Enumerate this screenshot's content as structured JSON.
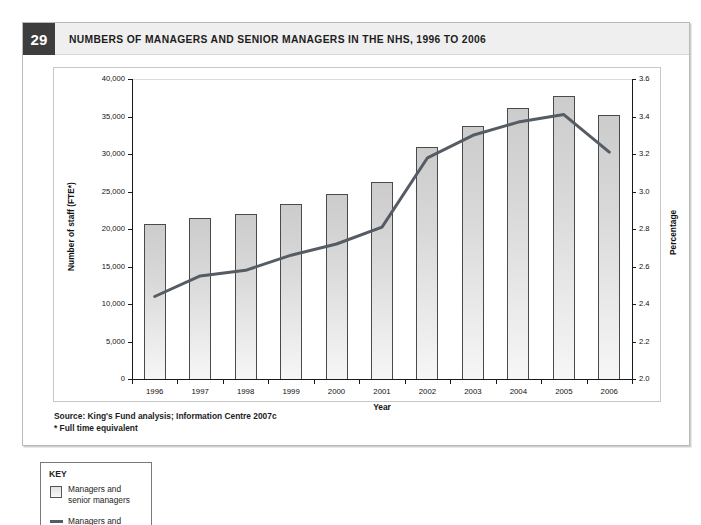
{
  "figure": {
    "number": "29",
    "title": "NUMBERS OF MANAGERS AND SENIOR MANAGERS IN THE NHS, 1996 TO 2006"
  },
  "notes": {
    "source": "Source: King's Fund analysis; Information Centre 2007c",
    "footnote": "* Full time equivalent"
  },
  "key": {
    "heading": "KEY",
    "bar_label_line1": "Managers and",
    "bar_label_line2": "senior managers",
    "line_label_line1": "Managers and"
  },
  "colors": {
    "badge_bg": "#3d3d3d",
    "header_bg": "#efefef",
    "bar_fill_top": "#cccccc",
    "bar_fill_bottom": "#f6f6f6",
    "bar_stroke": "#4a4a4a",
    "line_color": "#555c63",
    "axis_color": "#1a1a1a"
  },
  "chart_data": {
    "type": "bar",
    "title": "NUMBERS OF MANAGERS AND SENIOR MANAGERS IN THE NHS, 1996 TO 2006",
    "xlabel": "Year",
    "ylabel": "Number of staff (FTE*)",
    "y2label": "Percentage",
    "grid": false,
    "legend_position": "below-left",
    "categories": [
      "1996",
      "1997",
      "1998",
      "1999",
      "2000",
      "2001",
      "2002",
      "2003",
      "2004",
      "2005",
      "2006"
    ],
    "ylim": [
      0,
      40000
    ],
    "yticks": [
      "0",
      "5,000",
      "10,000",
      "15,000",
      "20,000",
      "25,000",
      "30,000",
      "35,000",
      "40,000"
    ],
    "ytick_values": [
      0,
      5000,
      10000,
      15000,
      20000,
      25000,
      30000,
      35000,
      40000
    ],
    "y2lim": [
      2.0,
      3.6
    ],
    "y2ticks": [
      "2.0",
      "2.2",
      "2.4",
      "2.6",
      "2.8",
      "3.0",
      "3.2",
      "3.4",
      "3.6"
    ],
    "y2tick_values": [
      2.0,
      2.2,
      2.4,
      2.6,
      2.8,
      3.0,
      3.2,
      3.4,
      3.6
    ],
    "series": [
      {
        "name": "Managers and senior managers",
        "type": "bar",
        "axis": "left",
        "values": [
          20700,
          21500,
          22000,
          23400,
          24700,
          26300,
          31000,
          33800,
          36100,
          37700,
          35200
        ]
      },
      {
        "name": "Managers and senior managers as a percentage of all staff",
        "type": "line",
        "axis": "right",
        "values": [
          2.44,
          2.55,
          2.58,
          2.66,
          2.72,
          2.81,
          3.18,
          3.3,
          3.37,
          3.41,
          3.21
        ]
      }
    ]
  }
}
